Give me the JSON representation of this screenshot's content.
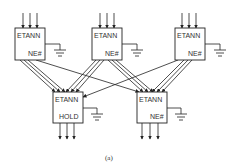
{
  "diagram": {
    "caption": "(a)",
    "top_row": [
      {
        "id": "etann-1",
        "title": "ETANN",
        "pin": "NE#"
      },
      {
        "id": "etann-2",
        "title": "ETANN",
        "pin": "NE#"
      },
      {
        "id": "etann-3",
        "title": "ETANN",
        "pin": "NE#"
      }
    ],
    "bottom_row": [
      {
        "id": "etann-4",
        "title": "ETANN",
        "pin": "HOLD"
      },
      {
        "id": "etann-5",
        "title": "ETANN",
        "pin": "NE#"
      }
    ],
    "inputs_per_top_box": 3,
    "outputs_per_bottom_box": 3,
    "ground_symbols": 5,
    "connections": "Each top ETANN feeds 3 lines into both bottom ETANN chips (fully connected); pins tied to ground"
  }
}
